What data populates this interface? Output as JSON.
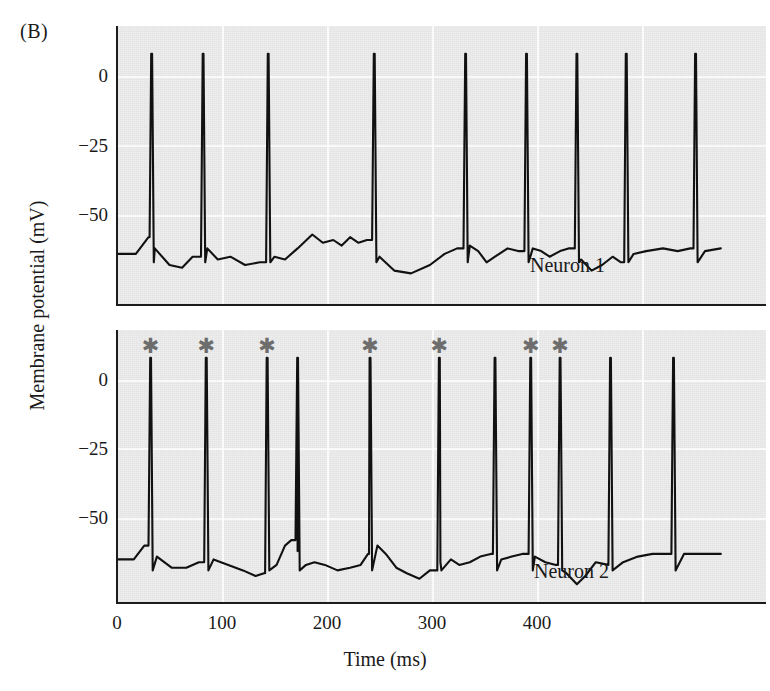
{
  "figure": {
    "panel_letter": "(B)",
    "y_axis_title": "Membrane potential (mV)",
    "x_axis_title": "Time (ms)"
  },
  "axes": {
    "y_ticks": [
      "0",
      "−25",
      "−50"
    ],
    "x_ticks": [
      "0",
      "100",
      "200",
      "300",
      "400"
    ],
    "y_unit": "mV",
    "x_unit": "ms"
  },
  "panels": [
    {
      "name": "Neuron 1",
      "label": "Neuron 1"
    },
    {
      "name": "Neuron 2",
      "label": "Neuron 2"
    }
  ],
  "annotations": {
    "marker_glyph": "✱",
    "marker_color": "#6d6d6d",
    "marker_meaning": "synchronized spike"
  },
  "colors": {
    "panel_background": "#eeeeee",
    "trace": "#111111",
    "axis": "#1c1c1c",
    "gridline": "#ffffff",
    "asterisk": "#6d6d6d",
    "page": "#ffffff"
  },
  "chart_data": {
    "type": "line",
    "title": "(B)",
    "xlabel": "Time (ms)",
    "ylabel": "Membrane potential (mV)",
    "xlim": [
      0,
      460
    ],
    "ylim": [
      -75,
      12
    ],
    "yticks": [
      0,
      -25,
      -50
    ],
    "xticks": [
      0,
      100,
      200,
      300,
      400
    ],
    "grid": true,
    "legend": "none",
    "subplots": [
      {
        "name": "Neuron 1",
        "spike_times_ms": [
          33,
          82,
          144,
          245,
          332,
          390,
          438,
          485,
          551
        ],
        "spike_peak_mV": 8,
        "resting_mV": -64,
        "baseline_points": [
          [
            0,
            -64
          ],
          [
            18,
            -64
          ],
          [
            30,
            -58
          ],
          [
            36,
            -62
          ],
          [
            50,
            -68
          ],
          [
            62,
            -69
          ],
          [
            72,
            -65
          ],
          [
            86,
            -62
          ],
          [
            96,
            -66
          ],
          [
            108,
            -65
          ],
          [
            122,
            -68
          ],
          [
            136,
            -67
          ],
          [
            150,
            -65
          ],
          [
            160,
            -66
          ],
          [
            172,
            -62
          ],
          [
            186,
            -57
          ],
          [
            196,
            -60
          ],
          [
            206,
            -59
          ],
          [
            214,
            -61
          ],
          [
            222,
            -58
          ],
          [
            230,
            -60
          ],
          [
            238,
            -59
          ],
          [
            250,
            -65
          ],
          [
            264,
            -70
          ],
          [
            280,
            -71
          ],
          [
            298,
            -68
          ],
          [
            312,
            -64
          ],
          [
            324,
            -62
          ],
          [
            336,
            -61
          ],
          [
            344,
            -63
          ],
          [
            352,
            -67
          ],
          [
            360,
            -65
          ],
          [
            372,
            -62
          ],
          [
            382,
            -63
          ],
          [
            396,
            -62
          ],
          [
            404,
            -63
          ],
          [
            412,
            -65
          ],
          [
            422,
            -63
          ],
          [
            430,
            -62
          ],
          [
            442,
            -66
          ],
          [
            452,
            -70
          ],
          [
            462,
            -68
          ],
          [
            472,
            -65
          ],
          [
            480,
            -67
          ],
          [
            492,
            -64
          ],
          [
            504,
            -63
          ],
          [
            520,
            -62
          ],
          [
            534,
            -63
          ],
          [
            546,
            -62
          ],
          [
            560,
            -63
          ],
          [
            575,
            -62
          ]
        ]
      },
      {
        "name": "Neuron 2",
        "spike_times_ms": [
          32,
          85,
          143,
          172,
          241,
          307,
          360,
          394,
          422,
          470,
          530
        ],
        "spike_peak_mV": 8,
        "resting_mV": -66,
        "synchronized_spike_times_ms": [
          32,
          85,
          143,
          241,
          307,
          394,
          422
        ],
        "baseline_points": [
          [
            0,
            -65
          ],
          [
            16,
            -65
          ],
          [
            26,
            -60
          ],
          [
            38,
            -64
          ],
          [
            52,
            -68
          ],
          [
            66,
            -68
          ],
          [
            78,
            -66
          ],
          [
            92,
            -65
          ],
          [
            106,
            -67
          ],
          [
            120,
            -69
          ],
          [
            132,
            -71
          ],
          [
            140,
            -70
          ],
          [
            152,
            -67
          ],
          [
            160,
            -60
          ],
          [
            166,
            -58
          ],
          [
            172,
            -62
          ],
          [
            180,
            -67
          ],
          [
            188,
            -66
          ],
          [
            198,
            -67
          ],
          [
            210,
            -69
          ],
          [
            222,
            -68
          ],
          [
            232,
            -67
          ],
          [
            240,
            -63
          ],
          [
            248,
            -60
          ],
          [
            256,
            -63
          ],
          [
            266,
            -68
          ],
          [
            276,
            -70
          ],
          [
            288,
            -72
          ],
          [
            298,
            -69
          ],
          [
            308,
            -66
          ],
          [
            318,
            -65
          ],
          [
            326,
            -67
          ],
          [
            336,
            -66
          ],
          [
            346,
            -64
          ],
          [
            356,
            -63
          ],
          [
            366,
            -65
          ],
          [
            376,
            -64
          ],
          [
            386,
            -63
          ],
          [
            398,
            -64
          ],
          [
            408,
            -66
          ],
          [
            418,
            -67
          ],
          [
            428,
            -70
          ],
          [
            438,
            -74
          ],
          [
            446,
            -71
          ],
          [
            456,
            -66
          ],
          [
            468,
            -67
          ],
          [
            482,
            -66
          ],
          [
            496,
            -64
          ],
          [
            510,
            -63
          ],
          [
            524,
            -63
          ],
          [
            540,
            -63
          ],
          [
            560,
            -63
          ],
          [
            575,
            -63
          ]
        ]
      }
    ]
  }
}
